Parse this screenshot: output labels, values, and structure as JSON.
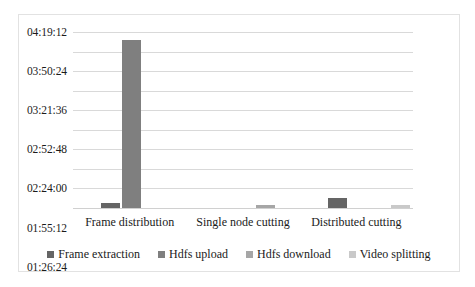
{
  "chart_data": {
    "type": "bar",
    "title": "",
    "subtitle": "",
    "xlabel": "",
    "ylabel": "",
    "grid": true,
    "legend_position": "bottom",
    "categories": [
      "Frame distribution",
      "Single node cutting",
      "Distributed cutting"
    ],
    "ytick_labels": [
      "00:00:00",
      "00:28:48",
      "00:57:36",
      "01:26:24",
      "01:55:12",
      "02:24:00",
      "02:52:48",
      "03:21:36",
      "03:50:24",
      "04:19:12"
    ],
    "ytick_seconds": [
      0,
      1728,
      3456,
      5184,
      6912,
      8640,
      10368,
      12096,
      13824,
      15552
    ],
    "ylim_seconds": [
      0,
      15552
    ],
    "y_axis_format": "hh:mm:ss",
    "series": [
      {
        "name": "Frame extraction",
        "color": "#656565",
        "values_hms": [
          "00:07:40",
          "00:00:00",
          "00:14:40"
        ],
        "values_seconds": [
          460,
          0,
          880
        ]
      },
      {
        "name": "Hdfs upload",
        "color": "#7f7f7f",
        "values_hms": [
          "04:07:26",
          "00:00:00",
          "00:00:00"
        ],
        "values_seconds": [
          14846,
          0,
          0
        ]
      },
      {
        "name": "Hdfs download",
        "color": "#a6a6a6",
        "values_hms": [
          "00:00:00",
          "00:04:20",
          "00:00:00"
        ],
        "values_seconds": [
          0,
          260,
          0
        ]
      },
      {
        "name": "Video splitting",
        "color": "#c9c9c9",
        "values_hms": [
          "00:00:00",
          "00:00:00",
          "00:04:20"
        ],
        "values_seconds": [
          0,
          0,
          260
        ]
      }
    ]
  },
  "colors": {
    "background": "#ffffff",
    "frame_border": "#e2e2e2",
    "gridline": "#d9d9d9",
    "text": "#1a1a1a"
  }
}
